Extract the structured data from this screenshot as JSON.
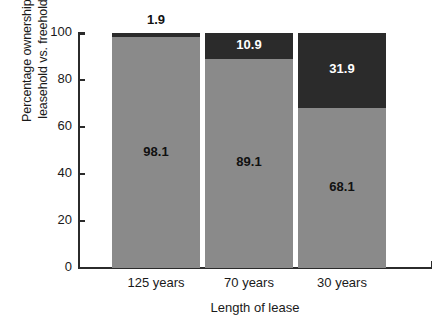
{
  "chart_data": {
    "type": "bar",
    "stacked": true,
    "title": "",
    "xlabel": "Length of lease",
    "ylabel": "Percentage ownership: leasehold vs. freehold",
    "ylabel_line1": "Percentage ownership:",
    "ylabel_line2": "leasehold vs. freehold",
    "categories": [
      "125 years",
      "70 years",
      "30 years"
    ],
    "ylim": [
      0,
      100
    ],
    "yticks": [
      0,
      20,
      40,
      60,
      80,
      100
    ],
    "ytick_labels": [
      "0",
      "20",
      "40",
      "60",
      "80",
      "100"
    ],
    "grid": false,
    "legend": "none",
    "series": [
      {
        "name": "leasehold",
        "color": "#8a8a8a",
        "values": [
          98.1,
          89.1,
          68.1
        ],
        "labels": [
          "98.1",
          "89.1",
          "68.1"
        ],
        "label_color": "#111111"
      },
      {
        "name": "freehold",
        "color": "#2b2b2b",
        "values": [
          1.9,
          10.9,
          31.9
        ],
        "labels": [
          "1.9",
          "10.9",
          "31.9"
        ],
        "label_color": "#ffffff",
        "label_placement": [
          "above-bar",
          "inside",
          "inside"
        ]
      }
    ]
  },
  "colors": {
    "lower_segment": "#8a8a8a",
    "upper_segment": "#2b2b2b",
    "axis": "#2b2b2b",
    "text": "#1a1a1a",
    "background": "#ffffff"
  }
}
